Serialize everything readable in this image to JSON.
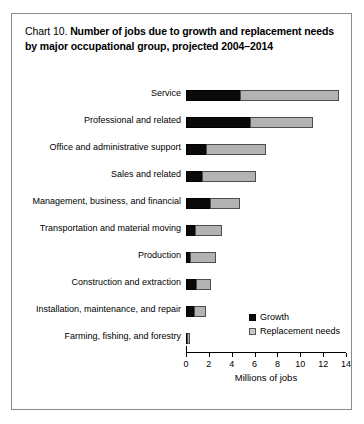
{
  "figure": {
    "chart_number": "Chart 10.",
    "title": "Number of jobs due to growth and replacement needs by major occupational group, projected 2004–2014"
  },
  "legend": {
    "position": "inside-bottom-right",
    "items": [
      {
        "label": "Growth",
        "color": "#0a0a0a",
        "swatch": "growth"
      },
      {
        "label": "Replacement needs",
        "color": "#c9c9c9",
        "swatch": "replacement"
      }
    ]
  },
  "axis": {
    "xlabel": "Millions of jobs",
    "ticks": [
      "0",
      "2",
      "4",
      "6",
      "8",
      "10",
      "12",
      "14"
    ]
  },
  "chart_data": {
    "type": "bar",
    "orientation": "horizontal",
    "stacked": true,
    "title": "Chart 10. Number of jobs due to growth and replacement needs by major occupational group, projected 2004–2014",
    "xlabel": "Millions of jobs",
    "ylabel": "",
    "xlim": [
      0,
      14
    ],
    "xticks": [
      0,
      2,
      4,
      6,
      8,
      10,
      12,
      14
    ],
    "grid": false,
    "legend_position": "inside-bottom-right",
    "categories": [
      "Service",
      "Professional and related",
      "Office and administrative support",
      "Sales and related",
      "Management, business, and financial",
      "Transportation and material moving",
      "Production",
      "Construction and extraction",
      "Installation, maintenance, and repair",
      "Farming, fishing, and forestry"
    ],
    "series": [
      {
        "name": "Growth",
        "color": "#0a0a0a",
        "values": [
          4.8,
          5.7,
          1.8,
          1.5,
          2.2,
          0.9,
          0.4,
          1.0,
          0.8,
          0.1
        ]
      },
      {
        "name": "Replacement needs",
        "color": "#b3b3b3",
        "values": [
          8.7,
          5.5,
          5.3,
          4.7,
          2.6,
          2.3,
          2.3,
          1.3,
          1.0,
          0.25
        ]
      }
    ],
    "totals": [
      13.5,
      11.2,
      7.1,
      6.2,
      4.8,
      3.2,
      2.7,
      2.3,
      1.8,
      0.35
    ]
  }
}
